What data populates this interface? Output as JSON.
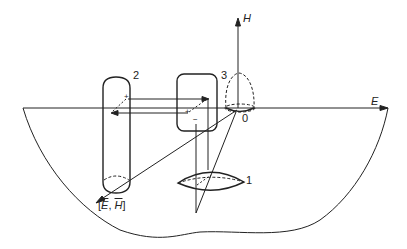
{
  "diagram": {
    "axes": {
      "vertical_label": "H",
      "horizontal_label": "E",
      "origin_label": "0",
      "diagonal_label": "[E, H]",
      "diagonal_label_parts": {
        "open": "[",
        "e": "E",
        "sep": ", ",
        "h": "H",
        "close": "]"
      }
    },
    "objects": [
      {
        "id": "1",
        "shape": "lens"
      },
      {
        "id": "2",
        "shape": "vertical-cylinder"
      },
      {
        "id": "3",
        "shape": "rounded-rectangle"
      }
    ],
    "charges": {
      "plus1": "+",
      "plus2": "+",
      "minus": "−"
    },
    "colors": {
      "stroke": "#222222",
      "background": "#ffffff"
    }
  }
}
